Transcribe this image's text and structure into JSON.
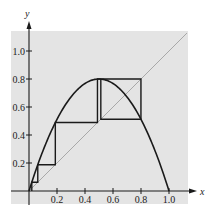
{
  "chart_data": {
    "type": "line",
    "title": "",
    "xlabel": "x",
    "ylabel": "y",
    "xlim": [
      0,
      1.15
    ],
    "ylim": [
      0,
      1.15
    ],
    "grid": false,
    "legend": null,
    "xticks": [
      0.2,
      0.4,
      0.6,
      0.8,
      1.0
    ],
    "xtick_labels": [
      "0.2",
      "0.4",
      "0.6",
      "0.8",
      "1.0"
    ],
    "yticks": [
      0.2,
      0.4,
      0.6,
      0.8,
      1.0
    ],
    "ytick_labels": [
      "0.2",
      "0.4",
      "0.6",
      "0.8",
      "1.0"
    ],
    "series": [
      {
        "name": "logistic-curve",
        "r": 3.2,
        "x": [
          0,
          0.1,
          0.2,
          0.3,
          0.4,
          0.5,
          0.6,
          0.7,
          0.8,
          0.9,
          1.0
        ],
        "y": [
          0,
          0.288,
          0.512,
          0.672,
          0.768,
          0.8,
          0.768,
          0.672,
          0.512,
          0.288,
          0
        ]
      },
      {
        "name": "diagonal-y-equals-x",
        "x": [
          0,
          1.15
        ],
        "y": [
          0,
          1.15
        ]
      },
      {
        "name": "cobweb-path",
        "x0": 0.02,
        "iterates": [
          0.02,
          0.0627,
          0.188,
          0.489,
          0.7997,
          0.513,
          0.7995,
          0.513,
          0.7995
        ]
      }
    ],
    "annotations": {
      "peak": [
        0.5,
        0.8
      ],
      "two_cycle": [
        0.513,
        0.7995
      ]
    }
  },
  "labels": {
    "x_axis": "x",
    "y_axis": "y",
    "xticks": [
      "0.2",
      "0.4",
      "0.6",
      "0.8",
      "1.0"
    ],
    "yticks": [
      "0.2",
      "0.4",
      "0.6",
      "0.8",
      "1.0"
    ]
  },
  "colors": {
    "background": "#e4e4e4",
    "axis": "#1a1a1a",
    "curve": "#1a1a1a",
    "diagonal": "#a8a8a8",
    "cobweb": "#1a1a1a"
  }
}
